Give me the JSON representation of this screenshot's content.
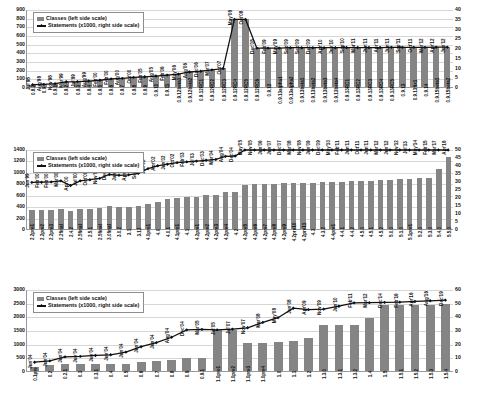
{
  "figure": {
    "title": "",
    "panels": 3
  },
  "legend": {
    "classes_label": "Classes (left side scale)",
    "statements_label": "Statements (x1000, right side scale)",
    "bar_color": "#858585",
    "line_color": "#111111"
  },
  "chart_data": [
    {
      "type": "bar",
      "id": "panel-1",
      "title": "",
      "xlabel": "",
      "ylabel": "Classes",
      "y2label": "Statements (x1000)",
      "ylim": [
        0,
        900
      ],
      "yticks": [
        0,
        100,
        200,
        300,
        400,
        500,
        600,
        700,
        800,
        900
      ],
      "y2lim": [
        0,
        40
      ],
      "y2ticks": [
        0,
        5,
        10,
        15,
        20,
        25,
        30,
        35,
        40
      ],
      "grid": true,
      "legend_position": "top-left",
      "categories": [
        "0.8.2",
        "0.9",
        "0.9.1",
        "0.9.2",
        "0.9.3",
        "0.9.4",
        "0.9.5",
        "0.9.6",
        "0.9.7",
        "0.9.8",
        "0.9.9",
        "0.9.10",
        "0.9.11",
        "0.9.12beta1",
        "0.9.12beta2",
        "0.9.12RC1",
        "0.9.12RC2",
        "0.9.12RC3",
        "0.9.12RC4",
        "0.9.12RC5",
        "0.9.12RC6",
        "0.9.12",
        "0.9.13alpha1",
        "0.9.13alpha2",
        "0.9.13beta1",
        "0.9.13beta2",
        "0.9.13beta3",
        "0.9.13beta4",
        "0.9.13RC1",
        "0.9.13RC2",
        "0.9.13RC3",
        "0.9.13RC4",
        "0.9.13RC5",
        "0.9.13",
        "0.9.13fix1",
        "0.9.14",
        "0.9.15beta1",
        "0.9.15beta2"
      ],
      "dates": [
        "Jul'98",
        "Aug'98",
        "Nov'98",
        "Mar'99",
        "Jul'99",
        "Aug'99",
        "Feb'00",
        "Feb'00",
        "Aug'00",
        "Oct'00",
        "Feb'05",
        "Aug'05",
        "Feb'06",
        "May'06",
        "Aug'06",
        "Dec'06",
        "Mar'07",
        "Oct'07",
        "May'08",
        "Oct'08",
        "Dec'08",
        "Feb'09",
        "May'09",
        "Sep'09",
        "Sep'09",
        "Dec'09",
        "Apr'10",
        "Jun'10",
        "Sep'10",
        "Mar'11",
        "Jun'11",
        "Apr'11",
        "Jun'11",
        "Sep'11",
        "Oct'11",
        "Mar'12",
        "Apr'12",
        "Jun'12",
        "Feb'13"
      ],
      "series": [
        {
          "name": "Classes (left side scale)",
          "axis": "left",
          "type": "bar",
          "values": [
            25,
            30,
            38,
            60,
            62,
            70,
            78,
            95,
            102,
            112,
            120,
            128,
            140,
            150,
            175,
            185,
            200,
            215,
            790,
            790,
            455,
            455,
            455,
            460,
            460,
            460,
            460,
            460,
            462,
            462,
            462,
            462,
            464,
            464,
            464,
            464,
            466,
            466
          ]
        },
        {
          "name": "Statements (x1000, right side scale)",
          "axis": "right",
          "type": "line",
          "values": [
            1.2,
            1.4,
            1.7,
            2.7,
            2.8,
            3.1,
            3.5,
            4.2,
            4.5,
            5.0,
            5.3,
            5.7,
            6.2,
            6.7,
            7.8,
            8.2,
            8.9,
            9.6,
            35.1,
            35.1,
            20.2,
            20.2,
            20.2,
            20.4,
            20.4,
            20.4,
            20.4,
            20.4,
            20.5,
            20.5,
            20.5,
            20.5,
            20.6,
            20.6,
            20.6,
            20.6,
            20.7,
            20.7
          ]
        }
      ]
    },
    {
      "type": "bar",
      "id": "panel-2",
      "title": "",
      "xlabel": "",
      "ylabel": "Classes",
      "y2label": "Statements (x1000)",
      "ylim": [
        0,
        1400
      ],
      "yticks": [
        0,
        200,
        400,
        600,
        800,
        1000,
        1200,
        1400
      ],
      "y2lim": [
        0,
        50
      ],
      "y2ticks": [
        0,
        5,
        10,
        15,
        20,
        25,
        30,
        35,
        40,
        45,
        50
      ],
      "grid": true,
      "legend_position": "top-left",
      "categories": [
        "2.2pre1",
        "2.2pre2",
        "2.2pre3",
        "2.2final",
        "2.4.2",
        "2.5final",
        "2.5.1",
        "2.5final",
        "3.0final",
        "3.0.2",
        "3.1",
        "3.12",
        "4.0pre1",
        "4.0",
        "4.0.1",
        "4.1pre1",
        "4.1",
        "4.2pre1",
        "4.2pre2",
        "4.2pre3",
        "4.2pre4",
        "4.2",
        "4.2pre5",
        "4.2pre6",
        "4.2pre7",
        "4.2pre8",
        "4.2pre9",
        "4.2pre10",
        "4.2pre11",
        "4.3",
        "4.3.2",
        "4.4pre1",
        "4.4.1",
        "4.4.2",
        "4.5.0",
        "4.5.1",
        "4.5.2",
        "5.0.0",
        "5.1.0",
        "5.1pre1",
        "5.2.0",
        "5.3.0",
        "5.4.0",
        "5.5.0"
      ],
      "dates": [
        "Jun'99",
        "Feb'00",
        "Feb'00",
        "Mar'00",
        "Apr'00",
        "Jul'00",
        "Oct'00",
        "Nov'00",
        "Dec'00",
        "Jan'01",
        "Apr'01",
        "Sep'01",
        "Jan'02",
        "Apr'02",
        "Jun'02",
        "Oct'02",
        "Feb'03",
        "Jul'03",
        "Dec'03",
        "Mar'04",
        "Aug'04",
        "Dec'04",
        "May'05",
        "Nov'05",
        "Jun'06",
        "Jun'07",
        "Dec'07",
        "Mar'08",
        "Nov'08",
        "Jun'09",
        "Dec'09",
        "May'10",
        "Feb'11",
        "Jun'11",
        "Oct'11",
        "Jun'11",
        "Mar'12",
        "Jun'12",
        "Nov'12",
        "Jul'13",
        "May'14",
        "Feb'15",
        "Mar'17",
        "Apr'18"
      ],
      "series": [
        {
          "name": "Classes (left side scale)",
          "axis": "left",
          "type": "bar",
          "values": [
            330,
            332,
            335,
            345,
            310,
            345,
            350,
            360,
            395,
            385,
            390,
            405,
            445,
            480,
            520,
            545,
            555,
            565,
            590,
            600,
            645,
            650,
            770,
            785,
            790,
            795,
            800,
            800,
            805,
            810,
            815,
            820,
            830,
            835,
            840,
            845,
            850,
            860,
            870,
            880,
            890,
            900,
            1050,
            1260
          ]
        },
        {
          "name": "Statements (x1000, right side scale)",
          "axis": "right",
          "type": "line",
          "values": [
            29.5,
            29.6,
            29.8,
            30.5,
            27.5,
            30.5,
            31.2,
            32.0,
            34.5,
            34.0,
            34.3,
            35.2,
            38.2,
            40.0,
            41.0,
            42.0,
            42.5,
            43.0,
            43.5,
            44.0,
            46.0,
            46.2,
            50.5,
            51.0,
            51.2,
            51.5,
            51.8,
            51.8,
            52.0,
            52.2,
            52.4,
            52.6,
            53.0,
            53.2,
            53.4,
            53.6,
            53.8,
            54.2,
            54.6,
            55.0,
            55.4,
            55.8,
            57.5,
            60.0
          ]
        }
      ]
    },
    {
      "type": "bar",
      "id": "panel-3",
      "title": "",
      "xlabel": "",
      "ylabel": "Classes",
      "y2label": "Statements (x1000)",
      "ylim": [
        0,
        3000
      ],
      "yticks": [
        0,
        500,
        1000,
        1500,
        2000,
        2500,
        3000
      ],
      "y2lim": [
        0,
        60
      ],
      "y2ticks": [
        0,
        10,
        20,
        30,
        40,
        50,
        60
      ],
      "grid": true,
      "legend_position": "top-left",
      "categories": [
        "0.1pre",
        "0.2",
        "0.2.1",
        "0.3",
        "0.3.1",
        "0.4",
        "0.5",
        "0.6",
        "0.7",
        "0.8",
        "0.9",
        "0.9.1",
        "1.0pre1",
        "1.0pre2",
        "1.0pre3",
        "1.0pre4",
        "1.0",
        "1.1",
        "1.2",
        "1.3.0",
        "1.3.1",
        "1.3.2",
        "1.4",
        "1.5",
        "1.5.1",
        "1.5.2",
        "1.5.3",
        "1.5.4"
      ],
      "dates": [
        "Jun'04",
        "Jun'04",
        "Jun'04",
        "Jun'04",
        "Jun'04",
        "Jun'04",
        "Jun'04",
        "Jun'04",
        "Jun'04",
        "Aug'04",
        "Dec'04",
        "Mar'05",
        "Jul'05",
        "Jul'07",
        "Nov'07",
        "Mar'08",
        "May'08",
        "Jun'08",
        "Apr'09",
        "Nov'09",
        "Jun'10",
        "Feb'11",
        "Mar'12",
        "Dec'14",
        "Feb'16",
        "Apr'16",
        "Aug'16",
        "Dec'19",
        "May'23"
      ],
      "series": [
        {
          "name": "Classes (left side scale)",
          "axis": "left",
          "type": "bar",
          "values": [
            160,
            220,
            250,
            255,
            258,
            262,
            270,
            330,
            380,
            420,
            470,
            480,
            1500,
            1500,
            1020,
            1030,
            1050,
            1100,
            1200,
            1680,
            1690,
            1700,
            1950,
            2400,
            2410,
            2420,
            2430,
            2440
          ]
        },
        {
          "name": "Statements (x1000, right side scale)",
          "axis": "right",
          "type": "line",
          "values": [
            6.5,
            7.5,
            10.5,
            10.8,
            11.5,
            12.0,
            14.0,
            18.0,
            21.0,
            25.0,
            30.5,
            30.8,
            30.5,
            31.0,
            32.0,
            36.0,
            39.5,
            46.5,
            45.5,
            45.8,
            48.0,
            50.5,
            50.6,
            50.8,
            51.0,
            51.5,
            52.0,
            52.5
          ]
        }
      ]
    }
  ]
}
